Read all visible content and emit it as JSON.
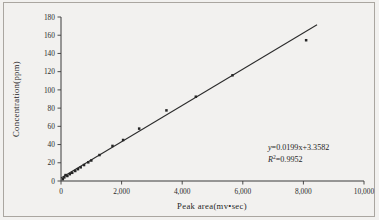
{
  "chart_data": {
    "type": "scatter",
    "title": "",
    "xlabel": "Peak area(mv•sec)",
    "ylabel": "Concentration(ppm)",
    "xlim": [
      0,
      10000
    ],
    "ylim": [
      0,
      180
    ],
    "xticks": [
      0,
      2000,
      4000,
      6000,
      8000,
      10000
    ],
    "yticks": [
      0,
      20,
      40,
      60,
      80,
      100,
      120,
      140,
      160,
      180
    ],
    "xticklabels": [
      "0",
      "2,000",
      "4,000",
      "6,000",
      "8,000",
      "10,000"
    ],
    "yticklabels": [
      "0",
      "20",
      "40",
      "60",
      "80",
      "100",
      "120",
      "140",
      "160",
      "180"
    ],
    "grid": false,
    "legend": null,
    "series": [
      {
        "name": "Calibration points",
        "marker": "filled-square",
        "color": "#262626",
        "x": [
          60,
          110,
          150,
          210,
          290,
          370,
          470,
          560,
          650,
          760,
          900,
          1000,
          1270,
          1700,
          2050,
          2580,
          3480,
          4450,
          5660,
          8090
        ],
        "y": [
          2.0,
          4.0,
          6.5,
          5.5,
          7.5,
          9.0,
          11.0,
          13.0,
          15.0,
          17.5,
          20.5,
          22.5,
          28.5,
          38.5,
          45.0,
          57.5,
          77.5,
          92.5,
          116.0,
          154.5
        ]
      }
    ],
    "fit_line": {
      "type": "line",
      "slope": 0.0199,
      "intercept": 3.3582,
      "x_start": 0,
      "x_end": 8450,
      "color": "#2b2b2b"
    },
    "annotations": {
      "equation_prefix": "y",
      "equation_body": "=0.0199x+3.3582",
      "r2_prefix": "R",
      "r2_sup": "2",
      "r2_body": "=0.9952"
    }
  },
  "figure": {
    "background_color": "#f2f1ef",
    "border_color": "#aaa6a0",
    "axis_color": "#3a3a3a",
    "text_color": "#1f1f1f"
  }
}
